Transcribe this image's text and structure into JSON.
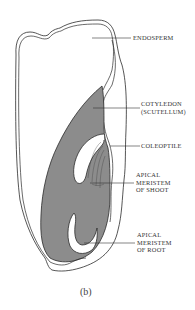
{
  "figure": {
    "caption": "(b)",
    "colors": {
      "embryo_fill": "#8c8c8c",
      "outline": "#2b2b2b",
      "background": "#ffffff",
      "label_text": "#333333"
    }
  },
  "labels": [
    {
      "id": "endosperm",
      "lines": [
        "ENDOSPERM"
      ]
    },
    {
      "id": "cotyledon",
      "lines": [
        "COTYLEDON",
        "(SCUTELLUM)"
      ]
    },
    {
      "id": "coleoptile",
      "lines": [
        "COLEOPTILE"
      ]
    },
    {
      "id": "apical-meristem-shoot",
      "lines": [
        "APICAL",
        "MERISTEM",
        "OF SHOOT"
      ]
    },
    {
      "id": "apical-meristem-root",
      "lines": [
        "APICAL",
        "MERISTEM",
        "OF ROOT"
      ]
    }
  ]
}
